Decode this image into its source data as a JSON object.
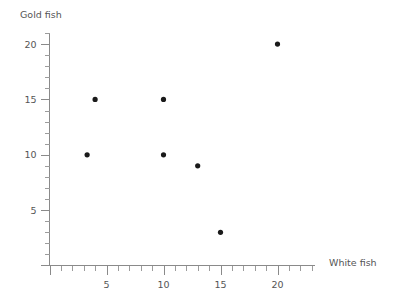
{
  "chart_data": {
    "type": "scatter",
    "title": "",
    "xlabel": "White fish",
    "ylabel": "Gold fish",
    "xlim": [
      0,
      22.5
    ],
    "ylim": [
      0,
      21
    ],
    "grid": false,
    "legend": null,
    "x_ticks_major": [
      5,
      10,
      15,
      20
    ],
    "x_tick_labels": [
      "5",
      "10",
      "15",
      "20"
    ],
    "y_ticks_major": [
      5,
      10,
      15,
      20
    ],
    "y_tick_labels": [
      "5",
      "10",
      "15",
      "20"
    ],
    "x_tick_minor_step": 1,
    "y_tick_minor_step": 1,
    "point_color": "#1a1a1a",
    "axis_color": "#8a8a8a",
    "text_color": "#555555",
    "points": [
      {
        "x": 3.3,
        "y": 10
      },
      {
        "x": 4,
        "y": 15
      },
      {
        "x": 10,
        "y": 15
      },
      {
        "x": 10,
        "y": 10
      },
      {
        "x": 13,
        "y": 9
      },
      {
        "x": 15,
        "y": 3
      },
      {
        "x": 20,
        "y": 20
      }
    ]
  },
  "axes": {
    "y_title": "Gold fish",
    "x_title": "White fish"
  }
}
